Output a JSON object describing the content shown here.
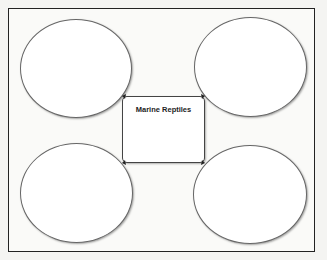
{
  "diagram": {
    "type": "bubble map",
    "center": {
      "label": "Marine Reptiles"
    },
    "bubbles": [
      {
        "position": "top-left",
        "label": ""
      },
      {
        "position": "top-right",
        "label": ""
      },
      {
        "position": "bottom-left",
        "label": ""
      },
      {
        "position": "bottom-right",
        "label": ""
      }
    ],
    "colors": {
      "border": "#222222",
      "ellipse_stroke": "#666666",
      "fill": "#ffffff"
    }
  }
}
